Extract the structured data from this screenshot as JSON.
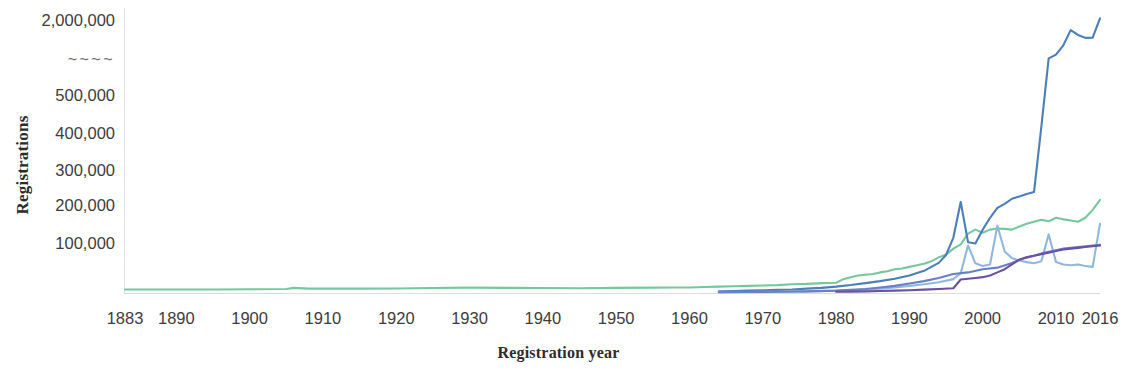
{
  "chart_data": {
    "type": "line",
    "title": "",
    "xlabel": "Registration year",
    "ylabel": "Registrations",
    "grid": false,
    "legend": "none",
    "axis_break_marker": "~~~~",
    "xlim": [
      1883,
      2016
    ],
    "ylim": [
      0,
      2000000
    ],
    "y_axis_note": "Broken (non-linear) y axis: linear 0-500,000 then a break, then 2,000,000",
    "x_tick_labels": [
      "1883",
      "1890",
      "1900",
      "1910",
      "1920",
      "1930",
      "1940",
      "1950",
      "1960",
      "1970",
      "1980",
      "1990",
      "2000",
      "2010",
      "2016"
    ],
    "x_ticks": [
      1883,
      1890,
      1900,
      1910,
      1920,
      1930,
      1940,
      1950,
      1960,
      1970,
      1980,
      1990,
      2000,
      2010,
      2016
    ],
    "y_tick_labels": [
      "2,000,000",
      "~~~~",
      "500,000",
      "400,000",
      "300,000",
      "200,000",
      "100,000"
    ],
    "y_ticks": [
      2000000,
      null,
      500000,
      400000,
      300000,
      200000,
      100000
    ],
    "series": [
      {
        "name": "series-green",
        "color": "#76c79b",
        "x": [
          1883,
          1890,
          1895,
          1900,
          1905,
          1906,
          1908,
          1910,
          1915,
          1920,
          1925,
          1930,
          1935,
          1940,
          1945,
          1950,
          1955,
          1958,
          1960,
          1962,
          1964,
          1966,
          1968,
          1970,
          1972,
          1974,
          1976,
          1978,
          1980,
          1981,
          1982,
          1983,
          1984,
          1985,
          1986,
          1987,
          1988,
          1989,
          1990,
          1991,
          1992,
          1993,
          1994,
          1995,
          1996,
          1997,
          1998,
          1999,
          2000,
          2001,
          2002,
          2003,
          2004,
          2005,
          2006,
          2007,
          2008,
          2009,
          2010,
          2011,
          2012,
          2013,
          2014,
          2015,
          2016
        ],
        "values": [
          9000,
          9000,
          9000,
          9500,
          10000,
          13000,
          11000,
          11000,
          11000,
          11500,
          12500,
          13500,
          13000,
          12500,
          12000,
          13000,
          13500,
          14000,
          14000,
          15000,
          16000,
          17000,
          18000,
          19000,
          20000,
          22000,
          23000,
          25000,
          26000,
          35000,
          40000,
          44000,
          46000,
          48000,
          52000,
          55000,
          60000,
          62000,
          66000,
          70000,
          74000,
          80000,
          90000,
          97000,
          112000,
          123000,
          150000,
          160000,
          152000,
          160000,
          163000,
          162000,
          160000,
          168000,
          175000,
          180000,
          185000,
          181000,
          190000,
          186000,
          183000,
          180000,
          190000,
          210000,
          235000
        ]
      },
      {
        "name": "series-steel-blue",
        "color": "#4a7fb8",
        "x": [
          1964,
          1966,
          1968,
          1970,
          1972,
          1974,
          1976,
          1978,
          1980,
          1982,
          1984,
          1986,
          1988,
          1990,
          1992,
          1994,
          1995,
          1996,
          1997,
          1998,
          1999,
          2000,
          2001,
          2002,
          2003,
          2004,
          2005,
          2006,
          2007,
          2008,
          2009,
          2010,
          2011,
          2012,
          2013,
          2014,
          2015,
          2016
        ],
        "values": [
          4000,
          5000,
          6000,
          7000,
          8000,
          9000,
          11000,
          13000,
          16000,
          20000,
          25000,
          30000,
          36000,
          44000,
          56000,
          76000,
          96000,
          140000,
          230000,
          128000,
          125000,
          160000,
          190000,
          215000,
          225000,
          238000,
          244000,
          250000,
          255000,
          420000,
          560000,
          700000,
          1050000,
          1620000,
          1440000,
          1330000,
          1340000,
          2060000
        ]
      },
      {
        "name": "series-light-blue",
        "color": "#90b8dd",
        "x": [
          1964,
          1968,
          1972,
          1976,
          1980,
          1982,
          1984,
          1986,
          1988,
          1990,
          1992,
          1994,
          1996,
          1997,
          1998,
          1999,
          2000,
          2001,
          2002,
          2003,
          2004,
          2005,
          2006,
          2007,
          2008,
          2009,
          2010,
          2011,
          2012,
          2013,
          2014,
          2015,
          2016
        ],
        "values": [
          2000,
          2500,
          3000,
          4000,
          5500,
          7000,
          9000,
          11000,
          14000,
          18000,
          22000,
          27000,
          35000,
          50000,
          120000,
          75000,
          68000,
          72000,
          170000,
          105000,
          88000,
          82000,
          78000,
          75000,
          80000,
          148000,
          78000,
          72000,
          70000,
          72000,
          68000,
          66000,
          175000
        ]
      },
      {
        "name": "series-slate-blue",
        "color": "#6a7fc4",
        "x": [
          1964,
          1968,
          1972,
          1976,
          1980,
          1982,
          1984,
          1986,
          1988,
          1990,
          1992,
          1994,
          1996,
          1998,
          2000,
          2002,
          2004,
          2005,
          2006,
          2007,
          2008,
          2009,
          2010,
          2011,
          2012,
          2013,
          2014,
          2015,
          2016
        ],
        "values": [
          2000,
          2500,
          3000,
          4000,
          6000,
          8000,
          10000,
          14000,
          18000,
          24000,
          30000,
          38000,
          48000,
          52000,
          60000,
          64000,
          76000,
          84000,
          90000,
          94000,
          100000,
          104000,
          108000,
          112000,
          114000,
          116000,
          118000,
          120000,
          122000
        ]
      },
      {
        "name": "series-purple",
        "color": "#6b4fa0",
        "x": [
          1980,
          1982,
          1984,
          1986,
          1988,
          1990,
          1992,
          1994,
          1996,
          1997,
          1998,
          1999,
          2000,
          2001,
          2002,
          2003,
          2004,
          2005,
          2006,
          2007,
          2008,
          2009,
          2010,
          2011,
          2012,
          2013,
          2014,
          2015,
          2016
        ],
        "values": [
          3000,
          3500,
          4000,
          5000,
          6000,
          7000,
          8500,
          10000,
          12000,
          34000,
          36000,
          38000,
          40000,
          44000,
          52000,
          60000,
          72000,
          84000,
          90000,
          94000,
          98000,
          102000,
          106000,
          110000,
          112000,
          114000,
          116000,
          118000,
          120000
        ]
      }
    ]
  }
}
